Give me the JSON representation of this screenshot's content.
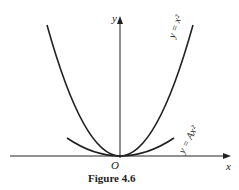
{
  "figure": {
    "caption": "Figure 4.6",
    "axes": {
      "x_label": "x",
      "y_label": "y",
      "origin_label": "O"
    },
    "curves": [
      {
        "name": "y = x^2",
        "label": "y = x²"
      },
      {
        "name": "y = Ax^2",
        "label": "y = Ax²"
      }
    ]
  }
}
